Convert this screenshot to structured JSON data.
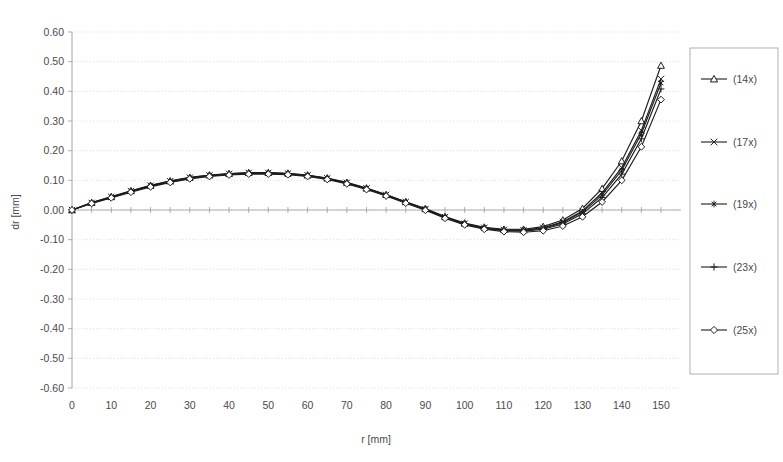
{
  "chart_data": {
    "type": "line",
    "title": "",
    "xlabel": "r [mm]",
    "ylabel": "dr [mm]",
    "xlim": [
      0,
      155
    ],
    "ylim": [
      -0.6,
      0.6
    ],
    "xticks": [
      0,
      10,
      20,
      30,
      40,
      50,
      60,
      70,
      80,
      90,
      100,
      110,
      120,
      130,
      140,
      150
    ],
    "xtick_labels": [
      "0",
      "10",
      "20",
      "30",
      "40",
      "50",
      "60",
      "70",
      "80",
      "90",
      "100",
      "110",
      "120",
      "130",
      "140",
      "150"
    ],
    "yticks": [
      0.6,
      0.5,
      0.4,
      0.3,
      0.2,
      0.1,
      0.0,
      -0.1,
      -0.2,
      -0.3,
      -0.4,
      -0.5,
      -0.6
    ],
    "ytick_labels": [
      "0.60",
      "0.50",
      "0.40",
      "0.30",
      "0.20",
      "0.10",
      "0.00",
      "-0.10",
      "-0.20",
      "-0.30",
      "-0.40",
      "-0.50",
      "-0.60"
    ],
    "grid": "horizontal-dotted",
    "legend_position": "right-outside",
    "x": [
      0,
      5,
      10,
      15,
      20,
      25,
      30,
      35,
      40,
      45,
      50,
      55,
      60,
      65,
      70,
      75,
      80,
      85,
      90,
      95,
      100,
      105,
      110,
      115,
      120,
      125,
      130,
      135,
      140,
      145,
      150
    ],
    "series": [
      {
        "name": "(14x)",
        "marker": "triangle",
        "values": [
          0.0,
          0.025,
          0.045,
          0.065,
          0.083,
          0.098,
          0.11,
          0.118,
          0.123,
          0.126,
          0.126,
          0.124,
          0.118,
          0.108,
          0.093,
          0.074,
          0.052,
          0.028,
          0.005,
          -0.022,
          -0.044,
          -0.058,
          -0.065,
          -0.065,
          -0.056,
          -0.034,
          0.005,
          0.072,
          0.165,
          0.3,
          0.487
        ]
      },
      {
        "name": "(17x)",
        "marker": "cross-x",
        "values": [
          0.0,
          0.024,
          0.044,
          0.064,
          0.082,
          0.097,
          0.109,
          0.117,
          0.122,
          0.125,
          0.125,
          0.123,
          0.117,
          0.107,
          0.092,
          0.073,
          0.051,
          0.027,
          0.003,
          -0.024,
          -0.046,
          -0.06,
          -0.067,
          -0.068,
          -0.06,
          -0.04,
          -0.003,
          0.058,
          0.143,
          0.268,
          0.442
        ]
      },
      {
        "name": "(19x)",
        "marker": "asterisk",
        "values": [
          0.0,
          0.024,
          0.043,
          0.063,
          0.081,
          0.096,
          0.108,
          0.116,
          0.121,
          0.124,
          0.124,
          0.122,
          0.116,
          0.106,
          0.091,
          0.072,
          0.05,
          0.026,
          0.002,
          -0.025,
          -0.047,
          -0.061,
          -0.068,
          -0.069,
          -0.062,
          -0.043,
          -0.007,
          0.051,
          0.134,
          0.257,
          0.428
        ]
      },
      {
        "name": "(23x)",
        "marker": "plus",
        "values": [
          0.0,
          0.023,
          0.042,
          0.062,
          0.08,
          0.095,
          0.107,
          0.115,
          0.12,
          0.123,
          0.123,
          0.121,
          0.115,
          0.105,
          0.09,
          0.071,
          0.049,
          0.025,
          0.001,
          -0.026,
          -0.048,
          -0.062,
          -0.07,
          -0.071,
          -0.065,
          -0.047,
          -0.013,
          0.042,
          0.121,
          0.24,
          0.408
        ]
      },
      {
        "name": "(25x)",
        "marker": "diamond",
        "values": [
          0.0,
          0.022,
          0.041,
          0.06,
          0.078,
          0.093,
          0.105,
          0.113,
          0.118,
          0.121,
          0.121,
          0.119,
          0.113,
          0.103,
          0.088,
          0.069,
          0.047,
          0.023,
          -0.001,
          -0.028,
          -0.05,
          -0.065,
          -0.073,
          -0.075,
          -0.07,
          -0.054,
          -0.023,
          0.027,
          0.1,
          0.213,
          0.372
        ]
      }
    ]
  },
  "legend": {
    "items": [
      {
        "label": "(14x)",
        "marker": "triangle"
      },
      {
        "label": "(17x)",
        "marker": "cross-x"
      },
      {
        "label": "(19x)",
        "marker": "asterisk"
      },
      {
        "label": "(23x)",
        "marker": "plus"
      },
      {
        "label": "(25x)",
        "marker": "diamond"
      }
    ]
  },
  "colors": {
    "series": "#1d1d1d",
    "grid": "#cfcfcf",
    "axis": "#9a9a9a",
    "text": "#4a4a4a",
    "background": "#ffffff"
  }
}
